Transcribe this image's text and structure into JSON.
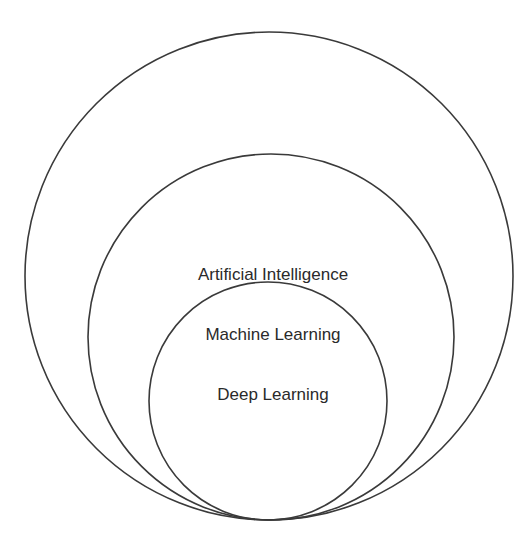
{
  "diagram": {
    "type": "nested-venn",
    "title": "",
    "stroke_color": "#3a3a3a",
    "text_color": "#2a2a2a",
    "background": "#ffffff",
    "circles": [
      {
        "id": "ai",
        "label": "Artificial Intelligence",
        "cx": 269,
        "cy": 276,
        "r": 244,
        "label_x": 273,
        "label_y": 280
      },
      {
        "id": "ml",
        "label": "Machine Learning",
        "cx": 271,
        "cy": 337,
        "r": 183,
        "label_x": 273,
        "label_y": 340
      },
      {
        "id": "dl",
        "label": "Deep Learning",
        "cx": 268,
        "cy": 401,
        "r": 119,
        "label_x": 273,
        "label_y": 400
      }
    ],
    "relationship": "Deep Learning ⊂ Machine Learning ⊂ Artificial Intelligence"
  }
}
